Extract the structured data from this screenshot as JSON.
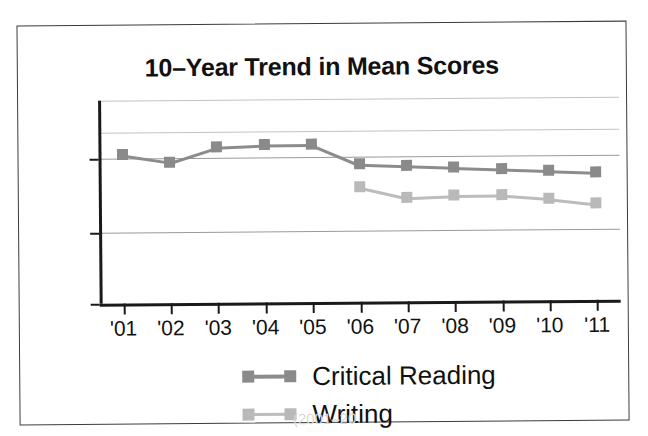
{
  "figure": {
    "title": "10–Year Trend in Mean Scores",
    "caption_partial": "(2001–20"
  },
  "colors": {
    "critical_reading": "#8a8a8a",
    "writing": "#b9b9b9",
    "axis": "#1a1a1a",
    "gridline": "#9a9a9a",
    "frame": "#3c3c3c",
    "text": "#111111"
  },
  "axes": {
    "y_tick_labels": [
      "505",
      "485",
      "475"
    ],
    "x_tick_labels": [
      "'01",
      "'02",
      "'03",
      "'04",
      "'05",
      "'06",
      "'07",
      "'08",
      "'09",
      "'10",
      "'11"
    ]
  },
  "legend": {
    "position": "below-plot",
    "entries": [
      {
        "label": "Critical Reading",
        "color_key": "critical_reading"
      },
      {
        "label": "Writing",
        "color_key": "writing"
      }
    ]
  },
  "chart_data": {
    "type": "line",
    "title": "10–Year Trend in Mean Scores",
    "xlabel": "",
    "ylabel": "",
    "x": [
      "'01",
      "'02",
      "'03",
      "'04",
      "'05",
      "'06",
      "'07",
      "'08",
      "'09",
      "'10",
      "'11"
    ],
    "ylim": [
      475,
      515
    ],
    "ytick_values": [
      505,
      485,
      475
    ],
    "grid": true,
    "grid_axis": "y",
    "legend_position": "below-plot",
    "series": [
      {
        "name": "Critical Reading",
        "color": "#8a8a8a",
        "marker": "square",
        "values": [
          506,
          504,
          508,
          508.5,
          508.5,
          503,
          502.5,
          502,
          501.5,
          501,
          500.5
        ]
      },
      {
        "name": "Writing",
        "color": "#b9b9b9",
        "marker": "square",
        "values": [
          null,
          null,
          null,
          null,
          null,
          497,
          494,
          494.5,
          494.5,
          493.5,
          492
        ]
      }
    ]
  }
}
